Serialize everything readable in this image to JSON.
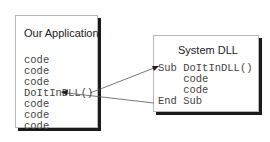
{
  "app_box": {
    "title": "Our Application",
    "lines": [
      "code",
      "code",
      "code",
      "DoItInDLL()",
      "code",
      "code",
      "code"
    ]
  },
  "dll_box": {
    "title": "System DLL",
    "lines": [
      "Sub DoItInDLL()",
      "    code",
      "    code",
      "End Sub"
    ]
  },
  "arrows": [
    {
      "from": "DoItInDLL()",
      "to": "Sub DoItInDLL()",
      "label": "call"
    },
    {
      "from": "End Sub",
      "to": "code (after call)",
      "label": "return"
    }
  ]
}
